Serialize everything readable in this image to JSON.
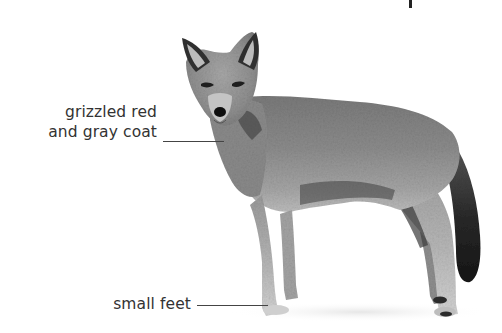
{
  "figure": {
    "labels": [
      {
        "id": "coat",
        "lines": [
          "grizzled red",
          "and gray coat"
        ]
      },
      {
        "id": "feet",
        "lines": [
          "small feet"
        ]
      }
    ],
    "colors": {
      "background": "#ffffff",
      "label_text": "#333333",
      "leader_line": "#444444"
    }
  }
}
